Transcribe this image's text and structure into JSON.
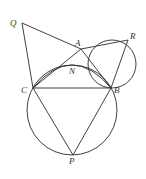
{
  "diagram": {
    "points": {
      "Q": {
        "label": "Q",
        "x": 22,
        "y": 23
      },
      "A": {
        "label": "A",
        "x": 81,
        "y": 49
      },
      "R": {
        "label": "R",
        "x": 128,
        "y": 40
      },
      "N": {
        "label": "N",
        "x": 76,
        "y": 66
      },
      "C": {
        "label": "C",
        "x": 33,
        "y": 88
      },
      "B": {
        "label": "B",
        "x": 111,
        "y": 88
      },
      "P": {
        "label": "P",
        "x": 73,
        "y": 155
      }
    },
    "segments": [
      "QA",
      "QC",
      "CA",
      "AR",
      "RB",
      "AB",
      "CB",
      "CP",
      "PB"
    ],
    "circles": [
      {
        "name": "small-circle",
        "through": [
          "A",
          "R",
          "B"
        ]
      },
      {
        "name": "large-circle",
        "through": [
          "C",
          "B",
          "P"
        ]
      }
    ],
    "arcs": [
      {
        "name": "arc-CNB",
        "through": [
          "C",
          "N",
          "B"
        ]
      }
    ]
  }
}
